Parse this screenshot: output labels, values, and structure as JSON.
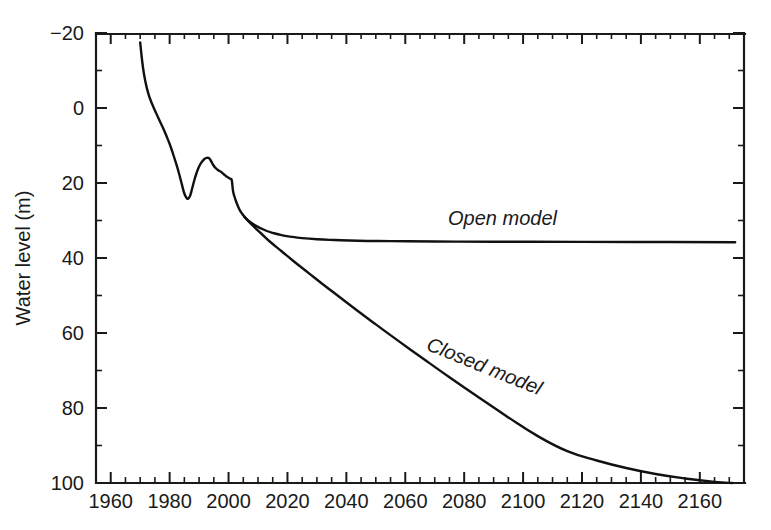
{
  "chart_data": {
    "type": "line",
    "title": "",
    "xlabel": "",
    "ylabel": "Water level (m)",
    "xlim": [
      1955,
      2175
    ],
    "ylim": [
      -20,
      100
    ],
    "y_inverted": true,
    "grid": false,
    "legend_position": "inline-annotations",
    "x_ticks": [
      1960,
      1980,
      2000,
      2020,
      2040,
      2060,
      2080,
      2100,
      2120,
      2140,
      2160
    ],
    "x_tick_labels": [
      "1960",
      "1980",
      "2000",
      "2020",
      "2040",
      "2060",
      "2080",
      "2100",
      "2120",
      "2140",
      "2160"
    ],
    "x_minor_tick_step": 5,
    "y_ticks": [
      -20,
      0,
      20,
      40,
      60,
      80,
      100
    ],
    "y_tick_labels": [
      "−20",
      "0",
      "20",
      "40",
      "60",
      "80",
      "100"
    ],
    "y_minor_tick_step": 10,
    "series": [
      {
        "name": "Historical",
        "label": "",
        "points": [
          [
            1970.0,
            -17.5
          ],
          [
            1970.6,
            -13.0
          ],
          [
            1971.3,
            -9.0
          ],
          [
            1972.2,
            -5.5
          ],
          [
            1973.2,
            -2.8
          ],
          [
            1974.3,
            -0.6
          ],
          [
            1975.5,
            1.5
          ],
          [
            1976.6,
            3.4
          ],
          [
            1977.8,
            5.4
          ],
          [
            1979.0,
            7.6
          ],
          [
            1980.2,
            10.0
          ],
          [
            1981.3,
            12.6
          ],
          [
            1982.4,
            15.3
          ],
          [
            1983.3,
            17.8
          ],
          [
            1984.2,
            20.5
          ],
          [
            1984.9,
            22.6
          ],
          [
            1985.6,
            23.8
          ],
          [
            1986.2,
            24.2
          ],
          [
            1986.9,
            23.5
          ],
          [
            1987.6,
            21.6
          ],
          [
            1988.4,
            19.2
          ],
          [
            1989.2,
            17.2
          ],
          [
            1990.0,
            15.6
          ],
          [
            1990.9,
            14.4
          ],
          [
            1991.8,
            13.6
          ],
          [
            1992.6,
            13.3
          ],
          [
            1993.4,
            13.4
          ],
          [
            1994.1,
            14.2
          ],
          [
            1994.8,
            15.2
          ],
          [
            1995.6,
            16.0
          ],
          [
            1996.5,
            16.6
          ],
          [
            1997.4,
            17.0
          ],
          [
            1998.3,
            17.6
          ],
          [
            1999.2,
            18.2
          ],
          [
            2000.0,
            18.6
          ],
          [
            2000.6,
            18.9
          ],
          [
            2001.1,
            19.3
          ],
          [
            2001.5,
            22.0
          ],
          [
            2002.0,
            23.6
          ],
          [
            2002.6,
            25.0
          ],
          [
            2003.3,
            26.4
          ],
          [
            2004.0,
            27.5
          ],
          [
            2004.8,
            28.4
          ],
          [
            2005.5,
            29.1
          ]
        ]
      },
      {
        "name": "Open model",
        "label": "Open model",
        "label_rotation": 0,
        "asymptote_level": 35.8,
        "points": [
          [
            2005.5,
            29.1
          ],
          [
            2007,
            30.2
          ],
          [
            2009,
            31.3
          ],
          [
            2011,
            32.1
          ],
          [
            2013,
            32.8
          ],
          [
            2015,
            33.3
          ],
          [
            2018,
            33.9
          ],
          [
            2021,
            34.3
          ],
          [
            2025,
            34.7
          ],
          [
            2030,
            35.0
          ],
          [
            2036,
            35.2
          ],
          [
            2044,
            35.4
          ],
          [
            2055,
            35.5
          ],
          [
            2070,
            35.6
          ],
          [
            2090,
            35.65
          ],
          [
            2120,
            35.7
          ],
          [
            2150,
            35.75
          ],
          [
            2172,
            35.8
          ]
        ]
      },
      {
        "name": "Closed model",
        "label": "Closed model",
        "label_rotation": 22,
        "points": [
          [
            2005.5,
            29.1
          ],
          [
            2008,
            31.2
          ],
          [
            2011,
            33.4
          ],
          [
            2014,
            35.6
          ],
          [
            2018,
            38.2
          ],
          [
            2022,
            40.8
          ],
          [
            2027,
            43.9
          ],
          [
            2032,
            47.0
          ],
          [
            2038,
            50.6
          ],
          [
            2044,
            54.2
          ],
          [
            2050,
            57.7
          ],
          [
            2058,
            62.3
          ],
          [
            2066,
            66.8
          ],
          [
            2075,
            71.8
          ],
          [
            2085,
            77.2
          ],
          [
            2095,
            82.5
          ],
          [
            2105,
            87.5
          ],
          [
            2115,
            91.5
          ],
          [
            2125,
            94.0
          ],
          [
            2135,
            96.0
          ],
          [
            2145,
            97.6
          ],
          [
            2155,
            98.8
          ],
          [
            2165,
            99.7
          ],
          [
            2171,
            100.0
          ]
        ]
      }
    ],
    "annotations": [
      {
        "text": "Open model",
        "x": 2093,
        "y": 31.2
      },
      {
        "text": "Closed model",
        "x": 2086,
        "y": 70.5
      }
    ]
  },
  "colors": {
    "line": "#111111",
    "axis": "#1a1a1a",
    "background": "#ffffff"
  }
}
